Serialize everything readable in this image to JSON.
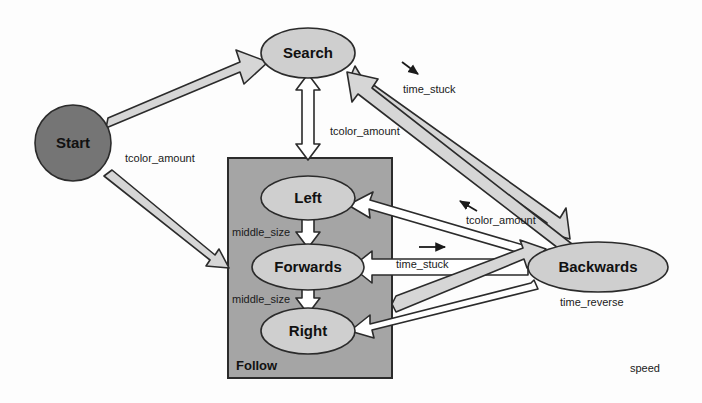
{
  "diagram": {
    "type": "state-machine-diagram",
    "background_color": "#fdfdfd",
    "palette": {
      "start_fill": "#757575",
      "state_fill": "#cfcfcf",
      "composite_fill": "#a5a5a5",
      "arrow_fill": "#d6d6d6",
      "stroke": "#2b2b2b",
      "text": "#111111"
    },
    "nodes": [
      {
        "id": "start",
        "label": "Start",
        "shape": "circle",
        "cx": 73,
        "cy": 143,
        "r": 38,
        "fill": "#757575"
      },
      {
        "id": "search",
        "label": "Search",
        "shape": "ellipse",
        "cx": 308,
        "cy": 53,
        "rx": 47,
        "ry": 25,
        "fill": "#cfcfcf"
      },
      {
        "id": "left",
        "label": "Left",
        "shape": "ellipse",
        "cx": 308,
        "cy": 198,
        "rx": 47,
        "ry": 22,
        "fill": "#cfcfcf"
      },
      {
        "id": "forwards",
        "label": "Forwards",
        "shape": "ellipse",
        "cx": 308,
        "cy": 267,
        "rx": 56,
        "ry": 23,
        "fill": "#cfcfcf"
      },
      {
        "id": "right",
        "label": "Right",
        "shape": "ellipse",
        "cx": 308,
        "cy": 331,
        "rx": 47,
        "ry": 23,
        "fill": "#cfcfcf"
      },
      {
        "id": "backwards",
        "label": "Backwards",
        "shape": "ellipse",
        "cx": 598,
        "cy": 267,
        "rx": 70,
        "ry": 25,
        "fill": "#cfcfcf"
      }
    ],
    "composite": {
      "id": "follow",
      "label": "Follow",
      "x": 228,
      "y": 158,
      "width": 164,
      "height": 220,
      "fill": "#a5a5a5",
      "label_x": 236,
      "label_y": 368
    },
    "edge_labels": [
      {
        "id": "start-search-label",
        "text": "tcolor_amount",
        "x": 125,
        "y": 162
      },
      {
        "id": "search-follow-label",
        "text": "tcolor_amount",
        "x": 330,
        "y": 135
      },
      {
        "id": "backwards-search-label",
        "text": "time_stuck",
        "x": 403,
        "y": 93
      },
      {
        "id": "search-backwards-label",
        "text": "tcolor_amount",
        "x": 466,
        "y": 224
      },
      {
        "id": "backwards-forwards-label",
        "text": "time_stuck",
        "x": 396,
        "y": 268
      },
      {
        "id": "left-middle-size-label",
        "text": "middle_size",
        "x": 232,
        "y": 236
      },
      {
        "id": "right-middle-size-label",
        "text": "middle_size",
        "x": 232,
        "y": 303
      },
      {
        "id": "backwards-right-label",
        "text": "time_reverse",
        "x": 560,
        "y": 306
      },
      {
        "id": "speed-label",
        "text": "speed",
        "x": 630,
        "y": 372
      }
    ],
    "direction_markers": [
      {
        "id": "marker-time-stuck-top",
        "x1": 402,
        "y1": 62,
        "x2": 419,
        "y2": 75
      },
      {
        "id": "marker-tcolor-amount-mid",
        "x1": 475,
        "y1": 210,
        "x2": 458,
        "y2": 200
      },
      {
        "id": "marker-time-stuck-mid",
        "x1": 420,
        "y1": 247,
        "x2": 447,
        "y2": 247
      }
    ],
    "edges": [
      {
        "id": "edge-start-search",
        "from": "start",
        "to": "search",
        "label": "tcolor_amount",
        "style": "block-arrow"
      },
      {
        "id": "edge-start-follow",
        "from": "start",
        "to": "follow",
        "label": "",
        "style": "block-arrow"
      },
      {
        "id": "edge-search-follow",
        "from": "search",
        "to": "follow",
        "label": "tcolor_amount",
        "style": "block-double-arrow"
      },
      {
        "id": "edge-backwards-search",
        "from": "backwards",
        "to": "search",
        "label": "time_stuck",
        "style": "block-arrow"
      },
      {
        "id": "edge-search-backwards",
        "from": "search",
        "to": "backwards",
        "label": "tcolor_amount",
        "style": "block-arrow"
      },
      {
        "id": "edge-backwards-left",
        "from": "backwards",
        "to": "left",
        "label": "tcolor_amount",
        "style": "block-arrow"
      },
      {
        "id": "edge-backwards-forwards",
        "from": "backwards",
        "to": "forwards",
        "label": "time_stuck",
        "style": "block-arrow"
      },
      {
        "id": "edge-forwards-backwards",
        "from": "forwards",
        "to": "backwards",
        "label": "",
        "style": "block-arrow"
      },
      {
        "id": "edge-backwards-right",
        "from": "backwards",
        "to": "right",
        "label": "time_reverse",
        "style": "block-arrow"
      },
      {
        "id": "edge-left-forwards",
        "from": "left",
        "to": "forwards",
        "label": "middle_size",
        "style": "block-arrow"
      },
      {
        "id": "edge-forwards-right",
        "from": "forwards",
        "to": "right",
        "label": "middle_size",
        "style": "block-arrow"
      }
    ]
  }
}
